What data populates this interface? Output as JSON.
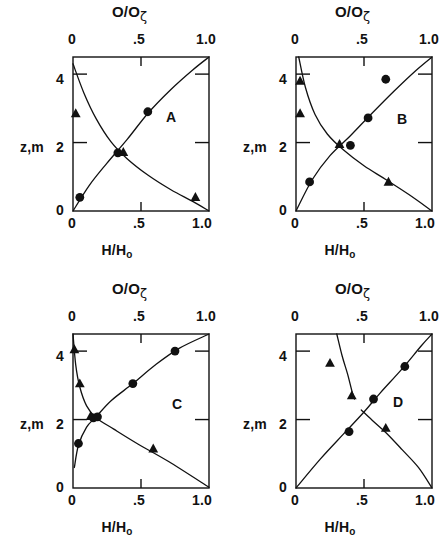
{
  "figure": {
    "background": "#ffffff",
    "ink": "#111111",
    "panel_count": 4
  },
  "axes": {
    "top_label_main": "O/O",
    "top_label_sub": "ζ",
    "bottom_label_main": "H/H",
    "bottom_label_sub": "o",
    "y_label": "z,m",
    "x_ticks": [
      "0",
      ".5",
      "1.0"
    ],
    "x_tick_values": [
      0,
      0.5,
      1.0
    ],
    "y_ticks": [
      "0",
      "2",
      "4"
    ],
    "y_tick_values": [
      0,
      2,
      4
    ],
    "xlim": [
      0,
      1.0
    ],
    "ylim": [
      0,
      4.5
    ]
  },
  "chart_data": [
    {
      "type": "scatter",
      "title": "A",
      "panel": "A",
      "xlabel": "H/Ho",
      "ylabel": "z,m",
      "top_xlabel": "O/Oζ",
      "xlim": [
        0,
        1.0
      ],
      "ylim": [
        0,
        4.5
      ],
      "grid": false,
      "legend": "none",
      "series": [
        {
          "name": "circles",
          "marker": "filled-circle",
          "points": [
            [
              0.05,
              0.4
            ],
            [
              0.33,
              1.7
            ],
            [
              0.55,
              2.9
            ]
          ]
        },
        {
          "name": "triangles",
          "marker": "filled-triangle",
          "points": [
            [
              0.02,
              2.85
            ],
            [
              0.37,
              1.72
            ],
            [
              0.9,
              0.4
            ]
          ]
        },
        {
          "name": "rising-curve",
          "marker": "line",
          "points": [
            [
              0.0,
              0.0
            ],
            [
              0.12,
              0.75
            ],
            [
              0.25,
              1.4
            ],
            [
              0.4,
              2.1
            ],
            [
              0.55,
              2.85
            ],
            [
              0.72,
              3.55
            ],
            [
              0.88,
              4.12
            ],
            [
              1.0,
              4.5
            ]
          ]
        },
        {
          "name": "falling-curve",
          "marker": "line",
          "points": [
            [
              0.0,
              4.3
            ],
            [
              0.08,
              3.45
            ],
            [
              0.17,
              2.7
            ],
            [
              0.28,
              2.02
            ],
            [
              0.4,
              1.52
            ],
            [
              0.55,
              1.05
            ],
            [
              0.72,
              0.62
            ],
            [
              0.88,
              0.28
            ],
            [
              1.0,
              0.0
            ]
          ]
        }
      ]
    },
    {
      "type": "scatter",
      "title": "B",
      "panel": "B",
      "xlabel": "H/Ho",
      "ylabel": "z,m",
      "top_xlabel": "O/Oζ",
      "xlim": [
        0,
        1.0
      ],
      "ylim": [
        0,
        4.5
      ],
      "grid": false,
      "legend": "none",
      "series": [
        {
          "name": "circles",
          "marker": "filled-circle",
          "points": [
            [
              0.1,
              0.85
            ],
            [
              0.4,
              1.92
            ],
            [
              0.53,
              2.72
            ],
            [
              0.66,
              3.85
            ]
          ]
        },
        {
          "name": "triangles",
          "marker": "filled-triangle",
          "points": [
            [
              0.03,
              3.8
            ],
            [
              0.03,
              2.85
            ],
            [
              0.32,
              1.95
            ],
            [
              0.68,
              0.85
            ]
          ]
        },
        {
          "name": "rising-curve",
          "marker": "line",
          "points": [
            [
              0.0,
              0.0
            ],
            [
              0.12,
              0.92
            ],
            [
              0.25,
              1.62
            ],
            [
              0.4,
              2.2
            ],
            [
              0.55,
              2.82
            ],
            [
              0.72,
              3.5
            ],
            [
              0.88,
              4.1
            ],
            [
              1.0,
              4.5
            ]
          ]
        },
        {
          "name": "falling-curve",
          "marker": "line",
          "points": [
            [
              0.02,
              4.5
            ],
            [
              0.07,
              3.6
            ],
            [
              0.14,
              2.82
            ],
            [
              0.23,
              2.25
            ],
            [
              0.35,
              1.78
            ],
            [
              0.5,
              1.32
            ],
            [
              0.66,
              0.92
            ],
            [
              0.83,
              0.48
            ],
            [
              1.0,
              0.0
            ]
          ]
        }
      ]
    },
    {
      "type": "scatter",
      "title": "C",
      "panel": "C",
      "xlabel": "H/Ho",
      "ylabel": "z,m",
      "top_xlabel": "O/Oζ",
      "xlim": [
        0,
        1.0
      ],
      "ylim": [
        0,
        4.5
      ],
      "grid": false,
      "legend": "none",
      "series": [
        {
          "name": "circles",
          "marker": "filled-circle",
          "points": [
            [
              0.04,
              1.3
            ],
            [
              0.15,
              2.05
            ],
            [
              0.18,
              2.08
            ],
            [
              0.44,
              3.05
            ],
            [
              0.75,
              4.0
            ]
          ]
        },
        {
          "name": "triangles",
          "marker": "filled-triangle",
          "points": [
            [
              0.01,
              4.05
            ],
            [
              0.05,
              3.05
            ],
            [
              0.13,
              2.1
            ],
            [
              0.59,
              1.15
            ]
          ]
        },
        {
          "name": "rising-curve",
          "marker": "line",
          "points": [
            [
              0.01,
              0.6
            ],
            [
              0.04,
              1.25
            ],
            [
              0.1,
              1.78
            ],
            [
              0.17,
              2.08
            ],
            [
              0.28,
              2.55
            ],
            [
              0.44,
              3.05
            ],
            [
              0.6,
              3.58
            ],
            [
              0.78,
              4.08
            ],
            [
              1.0,
              4.5
            ]
          ]
        },
        {
          "name": "falling-curve",
          "marker": "line",
          "points": [
            [
              0.0,
              4.5
            ],
            [
              0.02,
              3.6
            ],
            [
              0.05,
              2.95
            ],
            [
              0.1,
              2.4
            ],
            [
              0.17,
              2.05
            ],
            [
              0.3,
              1.72
            ],
            [
              0.48,
              1.28
            ],
            [
              0.7,
              0.78
            ],
            [
              1.0,
              0.02
            ]
          ]
        }
      ]
    },
    {
      "type": "scatter",
      "title": "D",
      "panel": "D",
      "xlabel": "H/Ho",
      "ylabel": "z,m",
      "top_xlabel": "O/Oζ",
      "xlim": [
        0,
        1.0
      ],
      "ylim": [
        0,
        4.5
      ],
      "grid": false,
      "legend": "none",
      "series": [
        {
          "name": "circles",
          "marker": "filled-circle",
          "points": [
            [
              0.39,
              1.65
            ],
            [
              0.57,
              2.6
            ],
            [
              0.8,
              3.55
            ]
          ]
        },
        {
          "name": "triangles",
          "marker": "filled-triangle",
          "points": [
            [
              0.25,
              3.65
            ],
            [
              0.41,
              2.7
            ],
            [
              0.66,
              1.75
            ]
          ]
        },
        {
          "name": "rising-curve",
          "marker": "line",
          "points": [
            [
              0.0,
              0.0
            ],
            [
              0.18,
              0.85
            ],
            [
              0.35,
              1.58
            ],
            [
              0.5,
              2.22
            ],
            [
              0.62,
              2.78
            ],
            [
              0.78,
              3.48
            ],
            [
              0.92,
              4.15
            ],
            [
              1.0,
              4.5
            ]
          ]
        },
        {
          "name": "falling-curve-upper",
          "marker": "line",
          "points": [
            [
              0.3,
              4.5
            ],
            [
              0.34,
              3.85
            ],
            [
              0.38,
              3.32
            ],
            [
              0.41,
              2.85
            ],
            [
              0.43,
              2.6
            ]
          ]
        },
        {
          "name": "falling-curve-lower",
          "marker": "line",
          "points": [
            [
              0.48,
              2.28
            ],
            [
              0.56,
              1.98
            ],
            [
              0.66,
              1.62
            ],
            [
              0.78,
              1.12
            ],
            [
              0.9,
              0.6
            ],
            [
              1.0,
              0.0
            ]
          ]
        }
      ]
    }
  ],
  "panels": [
    {
      "id": "A",
      "label": "A"
    },
    {
      "id": "B",
      "label": "B"
    },
    {
      "id": "C",
      "label": "C"
    },
    {
      "id": "D",
      "label": "D"
    }
  ]
}
